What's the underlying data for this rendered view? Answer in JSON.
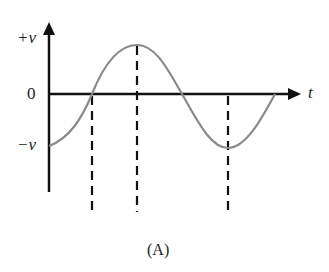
{
  "diagram": {
    "y_axis_labels": {
      "top": "+v",
      "zero": "0",
      "bottom": "−v"
    },
    "x_axis_label": "t",
    "caption": "(A)",
    "curve": {
      "type": "sine-like wave",
      "starts_at": "−v",
      "peak": "+v",
      "trough": "−v",
      "ends_at": "0"
    },
    "dashed_markers": [
      "zero crossing (rising)",
      "peak",
      "trough"
    ],
    "colors": {
      "axis": "#111111",
      "curve": "#8a8a8a",
      "dashes": "#111111"
    }
  }
}
